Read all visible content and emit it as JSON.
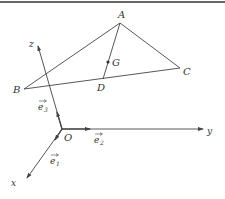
{
  "diagram": {
    "type": "3d-vector-coordinate-system",
    "colors": {
      "line": "#444444",
      "text": "#333333",
      "border": "#333333"
    },
    "points": {
      "A": {
        "label": "A"
      },
      "B": {
        "label": "B"
      },
      "C": {
        "label": "C"
      },
      "D": {
        "label": "D"
      },
      "G": {
        "label": "G"
      },
      "O": {
        "label": "O"
      }
    },
    "axes": {
      "x": {
        "label": "x"
      },
      "y": {
        "label": "y"
      },
      "z": {
        "label": "z"
      }
    },
    "basis_vectors": {
      "e1": {
        "label": "e",
        "subscript": "1"
      },
      "e2": {
        "label": "e",
        "subscript": "2"
      },
      "e3": {
        "label": "e",
        "subscript": "3"
      }
    },
    "edges": [
      "AB",
      "AC",
      "BC",
      "AD"
    ]
  }
}
